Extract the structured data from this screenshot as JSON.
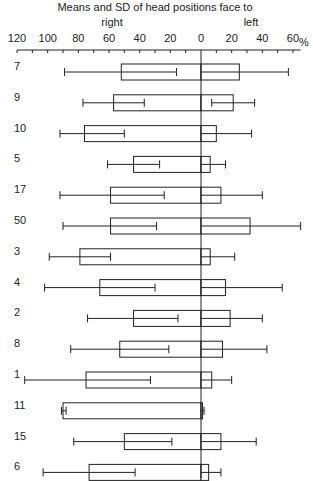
{
  "chart_data": {
    "type": "bar",
    "subtype": "horizontal-diverging-bar-with-error-bars",
    "title": "Means and SD of head positions face to",
    "direction_labels": {
      "right": "right",
      "left": "left"
    },
    "unit_label": "%",
    "x_ticks_right": [
      120,
      100,
      80,
      60,
      40,
      20,
      0
    ],
    "x_ticks_left": [
      20,
      40,
      60
    ],
    "xlim_right": [
      0,
      120
    ],
    "xlim_left": [
      0,
      65
    ],
    "minor_tick_step": 10,
    "grid": false,
    "categories": [
      "7",
      "9",
      "10",
      "5",
      "17",
      "50",
      "3",
      "4",
      "2",
      "8",
      "1",
      "11",
      "15",
      "6"
    ],
    "series": [
      {
        "name": "right",
        "means": [
          52,
          57,
          76,
          44,
          59,
          59,
          79,
          66,
          44,
          53,
          75,
          90,
          50,
          73
        ],
        "sd_low": [
          16,
          37,
          50,
          27,
          24,
          29,
          59,
          30,
          15,
          21,
          33,
          88,
          19,
          43
        ],
        "sd_high": [
          89,
          77,
          92,
          61,
          92,
          90,
          99,
          102,
          74,
          85,
          115,
          91,
          83,
          103
        ]
      },
      {
        "name": "left",
        "means": [
          25,
          21,
          10,
          6,
          13,
          32,
          6,
          16,
          19,
          14,
          7,
          1,
          13,
          5
        ],
        "sd_low": [
          0,
          7,
          0,
          0,
          0,
          0,
          0,
          0,
          0,
          0,
          0,
          0,
          0,
          0
        ],
        "sd_high": [
          57,
          35,
          33,
          16,
          40,
          65,
          22,
          53,
          40,
          43,
          20,
          2,
          36,
          13
        ]
      }
    ]
  }
}
